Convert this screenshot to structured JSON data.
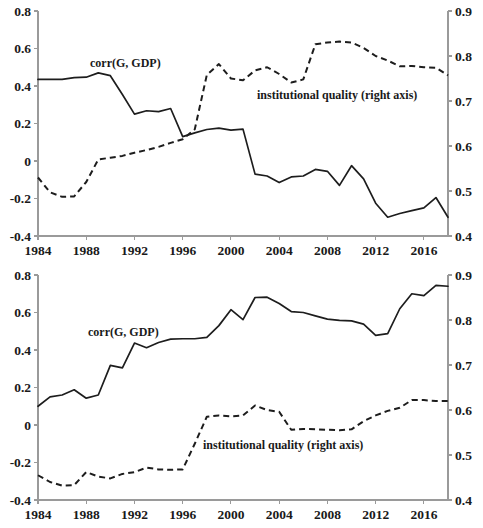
{
  "chart_data": [
    {
      "id": "top",
      "type": "line",
      "title": "",
      "xlabel": "",
      "ylabel": "",
      "xlim": [
        1984,
        2018
      ],
      "ylim": [
        -0.4,
        0.8
      ],
      "y2lim": [
        0.4,
        0.9
      ],
      "grid": false,
      "legend_position": "inline-annotation",
      "xticks": [
        1984,
        1988,
        1992,
        1996,
        2000,
        2004,
        2008,
        2012,
        2016
      ],
      "xtick_labels": [
        "1984",
        "1988",
        "1992",
        "1996",
        "2000",
        "2004",
        "2008",
        "2012",
        "2016"
      ],
      "yticks": [
        -0.4,
        -0.2,
        0,
        0.2,
        0.4,
        0.6,
        0.8
      ],
      "ytick_labels": [
        "-0.4",
        "-0.2",
        "0",
        "0.2",
        "0.4",
        "0.6",
        "0.8"
      ],
      "y2ticks": [
        0.4,
        0.5,
        0.6,
        0.7,
        0.8,
        0.9
      ],
      "y2tick_labels": [
        "0.4",
        "0.5",
        "0.6",
        "0.7",
        "0.8",
        "0.9"
      ],
      "x": [
        1984,
        1985,
        1986,
        1987,
        1988,
        1989,
        1990,
        1991,
        1992,
        1993,
        1994,
        1995,
        1996,
        1997,
        1998,
        1999,
        2000,
        2001,
        2002,
        2003,
        2004,
        2005,
        2006,
        2007,
        2008,
        2009,
        2010,
        2011,
        2012,
        2013,
        2014,
        2015,
        2016,
        2017,
        2018
      ],
      "series": [
        {
          "name": "corr(G, GDP)",
          "style": "solid",
          "axis": "left",
          "label": "corr(G, GDP)",
          "values": [
            0.435,
            0.435,
            0.435,
            0.445,
            0.447,
            0.47,
            0.455,
            0.355,
            0.25,
            0.268,
            0.263,
            0.28,
            0.13,
            0.15,
            0.168,
            0.175,
            0.165,
            0.17,
            -0.07,
            -0.08,
            -0.115,
            -0.085,
            -0.08,
            -0.045,
            -0.055,
            -0.13,
            -0.025,
            -0.095,
            -0.225,
            -0.3,
            -0.28,
            -0.265,
            -0.25,
            -0.195,
            -0.3
          ]
        },
        {
          "name": "institutional quality (right axis)",
          "style": "dashed",
          "axis": "right",
          "label": "institutional quality (right axis)",
          "values": [
            0.53,
            0.497,
            0.487,
            0.488,
            0.52,
            0.57,
            0.574,
            0.578,
            0.585,
            0.591,
            0.598,
            0.607,
            0.615,
            0.637,
            0.758,
            0.782,
            0.75,
            0.746,
            0.768,
            0.775,
            0.76,
            0.741,
            0.748,
            0.826,
            0.83,
            0.832,
            0.83,
            0.818,
            0.8,
            0.79,
            0.777,
            0.778,
            0.775,
            0.774,
            0.757
          ]
        }
      ]
    },
    {
      "id": "bottom",
      "type": "line",
      "title": "",
      "xlabel": "",
      "ylabel": "",
      "xlim": [
        1984,
        2018
      ],
      "ylim": [
        -0.4,
        0.8
      ],
      "y2lim": [
        0.4,
        0.9
      ],
      "grid": false,
      "legend_position": "inline-annotation",
      "xticks": [
        1984,
        1988,
        1992,
        1996,
        2000,
        2004,
        2008,
        2012,
        2016
      ],
      "xtick_labels": [
        "1984",
        "1988",
        "1992",
        "1996",
        "2000",
        "2004",
        "2008",
        "2012",
        "2016"
      ],
      "yticks": [
        -0.4,
        -0.2,
        0,
        0.2,
        0.4,
        0.6,
        0.8
      ],
      "ytick_labels": [
        "-0.4",
        "-0.2",
        "0",
        "0.2",
        "0.4",
        "0.6",
        "0.8"
      ],
      "y2ticks": [
        0.4,
        0.5,
        0.6,
        0.7,
        0.8,
        0.9
      ],
      "y2tick_labels": [
        "0.4",
        "0.5",
        "0.6",
        "0.7",
        "0.8",
        "0.9"
      ],
      "x": [
        1984,
        1985,
        1986,
        1987,
        1988,
        1989,
        1990,
        1991,
        1992,
        1993,
        1994,
        1995,
        1996,
        1997,
        1998,
        1999,
        2000,
        2001,
        2002,
        2003,
        2004,
        2005,
        2006,
        2007,
        2008,
        2009,
        2010,
        2011,
        2012,
        2013,
        2014,
        2015,
        2016,
        2017,
        2018
      ],
      "series": [
        {
          "name": "corr(G, GDP)",
          "style": "solid",
          "axis": "left",
          "label": "corr(G, GDP)",
          "values": [
            0.1,
            0.15,
            0.16,
            0.188,
            0.143,
            0.16,
            0.318,
            0.305,
            0.437,
            0.412,
            0.44,
            0.458,
            0.46,
            0.46,
            0.467,
            0.53,
            0.615,
            0.562,
            0.68,
            0.682,
            0.648,
            0.605,
            0.6,
            0.582,
            0.565,
            0.558,
            0.555,
            0.538,
            0.478,
            0.487,
            0.62,
            0.7,
            0.69,
            0.745,
            0.74
          ]
        },
        {
          "name": "institutional quality (right axis)",
          "style": "dashed",
          "axis": "right",
          "label": "institutional quality (right axis)",
          "values": [
            0.455,
            0.44,
            0.432,
            0.433,
            0.462,
            0.452,
            0.448,
            0.458,
            0.462,
            0.472,
            0.468,
            0.467,
            0.468,
            0.525,
            0.585,
            0.588,
            0.586,
            0.588,
            0.61,
            0.6,
            0.596,
            0.556,
            0.558,
            0.557,
            0.556,
            0.555,
            0.557,
            0.575,
            0.588,
            0.598,
            0.605,
            0.622,
            0.622,
            0.62,
            0.62
          ]
        }
      ]
    }
  ]
}
